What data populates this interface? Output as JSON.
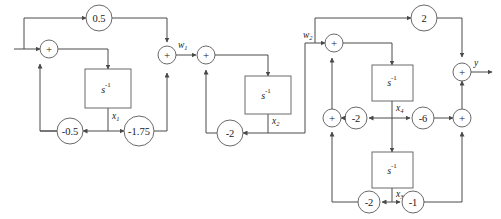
{
  "diagram": {
    "type": "block-diagram",
    "colors": {
      "wire": "#4a4a4a",
      "node_stroke": "#6a6a6a",
      "background": "#ffffff",
      "text": "#1a1a1a"
    },
    "signals": {
      "input": "u",
      "output": "y",
      "intermediate_1": "w",
      "intermediate_1_sub": "1",
      "intermediate_2": "w",
      "intermediate_2_sub": "2",
      "state_1": "x",
      "state_1_sub": "1",
      "state_2": "x",
      "state_2_sub": "2",
      "state_3": "x",
      "state_3_sub": "3",
      "state_4": "x",
      "state_4_sub": "4"
    },
    "integrators": [
      {
        "id": "int1",
        "label": "s",
        "exponent": "-1",
        "state": "x",
        "state_sub": "1"
      },
      {
        "id": "int2",
        "label": "s",
        "exponent": "-1",
        "state": "x",
        "state_sub": "2"
      },
      {
        "id": "int4",
        "label": "s",
        "exponent": "-1",
        "state": "x",
        "state_sub": "4"
      },
      {
        "id": "int3",
        "label": "s",
        "exponent": "-1",
        "state": "x",
        "state_sub": "3"
      }
    ],
    "gains": [
      {
        "id": "gain-top-left",
        "value": "0.5"
      },
      {
        "id": "gain-feedback-a",
        "value": "-0.5"
      },
      {
        "id": "gain-feedback-b",
        "value": "-1.75"
      },
      {
        "id": "gain-mid-feedback",
        "value": "-2"
      },
      {
        "id": "gain-top-right",
        "value": "2"
      },
      {
        "id": "gain-x4-left",
        "value": "-2"
      },
      {
        "id": "gain-x4-right",
        "value": "-6"
      },
      {
        "id": "gain-x3-left",
        "value": "-2"
      },
      {
        "id": "gain-x3-right",
        "value": "-1"
      }
    ],
    "summers": [
      {
        "id": "sum-1",
        "symbol": "+"
      },
      {
        "id": "sum-2",
        "symbol": "+"
      },
      {
        "id": "sum-3",
        "symbol": "+"
      },
      {
        "id": "sum-4",
        "symbol": "+"
      },
      {
        "id": "sum-5",
        "symbol": "+"
      },
      {
        "id": "sum-6",
        "symbol": "+"
      },
      {
        "id": "sum-7",
        "symbol": "+"
      }
    ]
  }
}
